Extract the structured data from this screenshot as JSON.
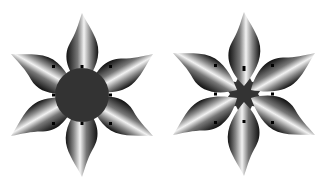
{
  "canvas": {
    "width": 333,
    "height": 185,
    "background": "#ffffff"
  },
  "flowers": [
    {
      "name": "flower-with-round-center",
      "cx": 82,
      "cy": 95,
      "petals": 6,
      "center_shape": "circle",
      "center_radius": 27,
      "center_color": "#333333"
    },
    {
      "name": "flower-with-star-center",
      "cx": 244,
      "cy": 94,
      "petals": 6,
      "center_shape": "star",
      "center_color": "#333333"
    }
  ],
  "colors": {
    "petal_dark": "#111111",
    "petal_light": "#f2f2f2",
    "dot": "#000000"
  }
}
